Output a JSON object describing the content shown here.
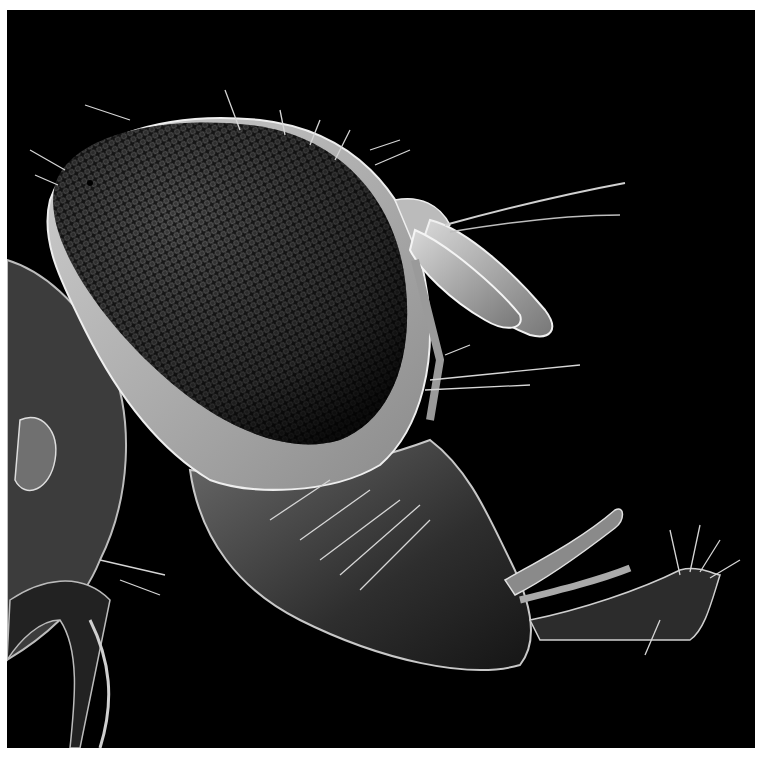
{
  "image": {
    "subject": "Scanning electron micrograph of a fly head in profile",
    "background_color": "#000000",
    "border_color": "#ffffff",
    "tone": "grayscale"
  },
  "regions": {
    "compound_eye": "large oval faceted compound eye",
    "antennae": "paired flattened antennal segments with arista bristles",
    "mouthparts": "proboscis with maxillary palp and labellum",
    "thorax_edge": "partial thorax at left edge"
  }
}
